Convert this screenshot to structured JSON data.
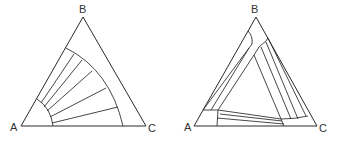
{
  "figure": {
    "left_diagram": {
      "vertices": {
        "A": "A",
        "B": "B",
        "C": "C"
      },
      "description": "Ternary diagram with a two-phase region bounded by two arcs and tie lines radiating from the A corner"
    },
    "right_diagram": {
      "vertices": {
        "A": "A",
        "B": "B",
        "C": "C"
      },
      "description": "Ternary diagram with three two-phase bands along each edge, each containing tie lines, enclosing a central single-phase region"
    }
  }
}
